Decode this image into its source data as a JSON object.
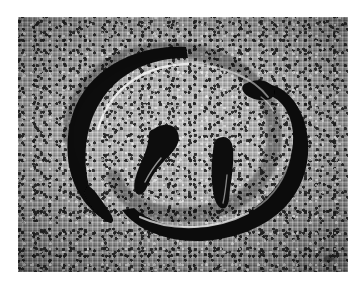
{
  "image": {
    "kind": "photograph",
    "title": "Black swirl object on woven fabric",
    "alt_text": "Grayscale photograph of a black S-shaped swirl resting on coarse woven burlap cloth",
    "canvas": {
      "width": 360,
      "height": 286,
      "background": "#ffffff"
    },
    "plate": {
      "x": 18,
      "y": 17,
      "width": 330,
      "height": 255
    },
    "palette": {
      "page_background": "#ffffff",
      "cloth_light": "#c4c4c4",
      "cloth_mid": "#a8a8a8",
      "cloth_dark": "#7c7c7c",
      "speckle_dark": "#141414",
      "speckle_light": "#f8f8f8",
      "object_black": "#0a0a0a",
      "object_highlight": "#f2f2f2"
    },
    "subject": {
      "name": "interlocking-swirl",
      "description": "Two interlocking crescent arcs forming an S / yin-yang spiral",
      "parts": [
        {
          "id": "left-arc",
          "label": "Left crescent arc with tapered pointed tail at lower-left"
        },
        {
          "id": "right-arc",
          "label": "Right crescent arc with blunt rounded tip at upper-right"
        },
        {
          "id": "left-hook",
          "label": "Inner upper hook blob in the centre"
        },
        {
          "id": "right-hook",
          "label": "Inner lower hook blob in the centre"
        },
        {
          "id": "highlight",
          "label": "Specular white highlight along inner edge of arcs"
        }
      ]
    },
    "background": {
      "material": "woven burlap / canvas cloth",
      "weave": "plain over-under weave with dark slub speckles"
    }
  }
}
